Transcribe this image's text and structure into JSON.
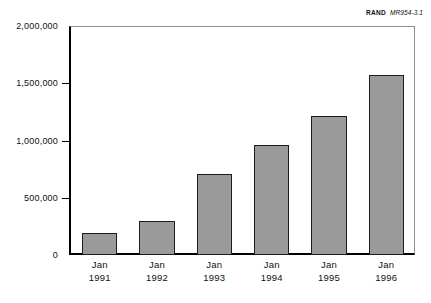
{
  "figure": {
    "credit_mark": "RAND",
    "credit_doc": "MR954-3.1"
  },
  "chart_data": {
    "type": "bar",
    "title": "",
    "subtitle": "",
    "xlabel": "",
    "ylabel": "",
    "categories": [
      "Jan 1991",
      "Jan 1992",
      "Jan 1993",
      "Jan 1994",
      "Jan 1995",
      "Jan 1996"
    ],
    "category_month": [
      "Jan",
      "Jan",
      "Jan",
      "Jan",
      "Jan",
      "Jan"
    ],
    "category_year": [
      "1991",
      "1992",
      "1993",
      "1994",
      "1995",
      "1996"
    ],
    "values": [
      190000,
      300000,
      710000,
      960000,
      1210000,
      1570000
    ],
    "ylim": [
      0,
      2000000
    ],
    "yticks": [
      0,
      500000,
      1000000,
      1500000,
      2000000
    ],
    "ytick_labels": [
      "0",
      "500,000",
      "1,000,000",
      "1,500,000",
      "2,000,000"
    ],
    "grid": false,
    "legend": null,
    "bar_fill_color": "#9a9a9a",
    "bar_edge_color": "#1c1c1c",
    "axis_color": "#000000",
    "background_color": "#ffffff"
  }
}
